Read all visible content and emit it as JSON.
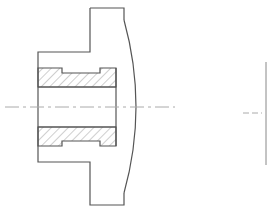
{
  "diagram": {
    "type": "engineering-section-drawing",
    "colors": {
      "outline": "#555555",
      "hatch": "#777777",
      "centerline": "#aaaaaa",
      "background": "#ffffff"
    },
    "hub_outline_points": "90,8 124,8 124,20",
    "hub_curve_path": "M124,20 Q148,107 124,193",
    "hub_outline_rest": "124,193 124,205 90,205 90,162 38,162 38,52 90,52 90,8",
    "upper_bush_path": "M38,68 L62,68 L62,73 L100,73 L100,68 L116,68 L116,87 L38,87 Z",
    "lower_bush_path": "M38,127 L116,127 L116,146 L100,146 L100,141 L62,141 L62,146 L38,146 Z",
    "bore_lines": [
      {
        "x1": 38,
        "y1": 87,
        "x2": 116,
        "y2": 87
      },
      {
        "x1": 38,
        "y1": 127,
        "x2": 116,
        "y2": 127
      },
      {
        "x1": 116,
        "y1": 68,
        "x2": 116,
        "y2": 146
      }
    ],
    "centerline": {
      "x1": 5,
      "y1": 107,
      "x2": 175,
      "y2": 107
    },
    "right_view": {
      "centerline": {
        "x1": 243,
        "y1": 113,
        "x2": 262,
        "y2": 113
      },
      "edge_line": {
        "x1": 266,
        "y1": 62,
        "x2": 266,
        "y2": 165
      }
    }
  }
}
